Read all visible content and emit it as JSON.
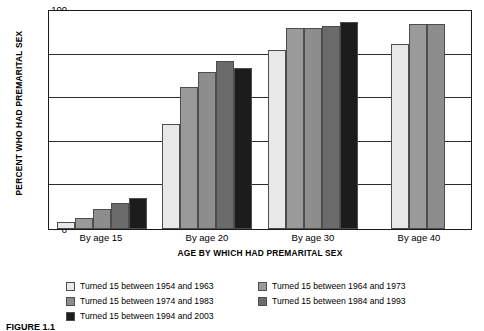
{
  "chart_data": {
    "type": "bar",
    "title": "",
    "xlabel": "AGE BY WHICH HAD PREMARITAL SEX",
    "ylabel": "PERCENT WHO HAD PREMARITAL SEX",
    "ylim": [
      0,
      100
    ],
    "yticks": [
      0,
      20,
      40,
      60,
      80,
      100
    ],
    "grid": true,
    "legend_position": "bottom",
    "categories": [
      "By age 15",
      "By age 20",
      "By age 30",
      "By age 40"
    ],
    "series": [
      {
        "name": "Turned 15 between 1954 and 1963",
        "color": "#e8e8e8",
        "values": [
          3,
          48,
          82,
          85
        ]
      },
      {
        "name": "Turned 15 between 1964 and 1973",
        "color": "#9a9a9a",
        "values": [
          5,
          65,
          92,
          94
        ]
      },
      {
        "name": "Turned 15 between 1974 and 1983",
        "color": "#8d8d8d",
        "values": [
          9,
          72,
          92,
          94
        ]
      },
      {
        "name": "Turned 15 between 1984 and 1993",
        "color": "#6b6b6b",
        "values": [
          12,
          77,
          93,
          null
        ]
      },
      {
        "name": "Turned 15 between 1994 and 2003",
        "color": "#1c1c1c",
        "values": [
          14,
          74,
          95,
          null
        ]
      }
    ]
  },
  "caption": {
    "text": "FIGURE 1.1"
  }
}
